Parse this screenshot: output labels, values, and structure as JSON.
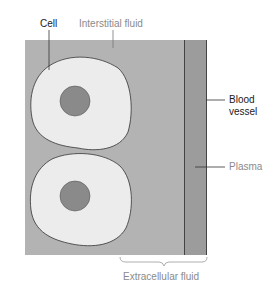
{
  "labels": {
    "cell": "Cell",
    "interstitial_fluid": "Interstitial fluid",
    "blood_vessel_line1": "Blood",
    "blood_vessel_line2": "vessel",
    "plasma": "Plasma",
    "extracellular_fluid": "Extracellular fluid"
  },
  "colors": {
    "interstitial": "#b3b3b3",
    "vessel": "#9c9c9c",
    "cell_fill": "#ececec",
    "nucleus": "#8a8a8a",
    "outline": "#333333",
    "label_dark": "#1a1a1a",
    "label_light": "#8a8a8a"
  }
}
